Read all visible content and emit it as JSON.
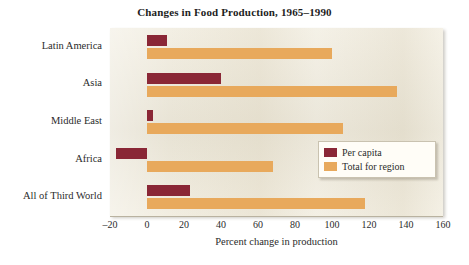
{
  "chart_data": {
    "type": "bar",
    "orientation": "horizontal",
    "title": "Changes in Food Production, 1965–1990",
    "xlabel": "Percent change in production",
    "ylabel": "",
    "xlim": [
      -20,
      160
    ],
    "xticks": [
      -20,
      0,
      20,
      40,
      60,
      80,
      100,
      120,
      140,
      160
    ],
    "xtick_labels": [
      "–20",
      "0",
      "20",
      "40",
      "60",
      "80",
      "100",
      "120",
      "140",
      "160"
    ],
    "grid": false,
    "legend_position": "center-right",
    "categories": [
      "Latin America",
      "Asia",
      "Middle East",
      "Africa",
      "All of Third World"
    ],
    "series": [
      {
        "name": "Per capita",
        "color": "#8a2736",
        "values": [
          11,
          40,
          3,
          -17,
          23
        ]
      },
      {
        "name": "Total for region",
        "color": "#e8a95c",
        "values": [
          100,
          135,
          106,
          68,
          118
        ]
      }
    ]
  },
  "legend": {
    "items": [
      {
        "label": "Per capita",
        "swatch": "per-capita"
      },
      {
        "label": "Total for region",
        "swatch": "total"
      }
    ]
  },
  "colors": {
    "per_capita": "#8a2736",
    "total_for_region": "#e8a95c",
    "plot_background": "#efeadb",
    "page_background": "#ffffff",
    "text": "#2b2b2b"
  }
}
